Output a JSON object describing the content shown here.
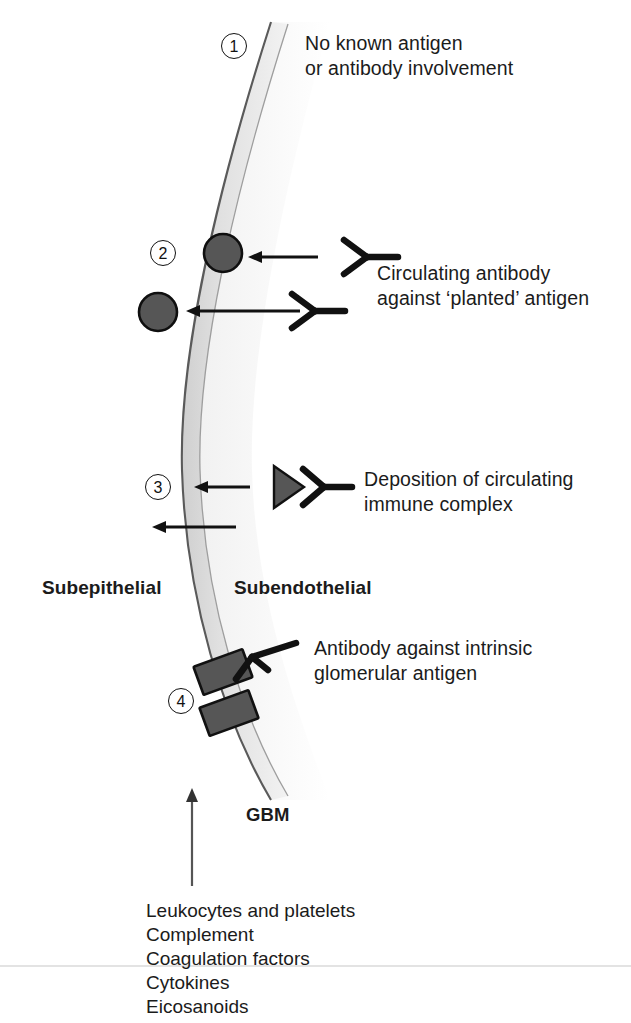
{
  "figure": {
    "background_color": "#ffffff",
    "membrane_color_light": "#e4e4e4",
    "membrane_color_mid": "#d2d2d2",
    "membrane_outline_color": "#6e6e6e",
    "particle_fill_color": "#565656",
    "particle_outline_color": "#0f0f0f",
    "ink_color": "#111111",
    "text_color": "#1b1b1b"
  },
  "markers": {
    "one": "1",
    "two": "2",
    "three": "3",
    "four": "4"
  },
  "annotations": {
    "one": {
      "line1": "No known antigen",
      "line2": "or antibody involvement"
    },
    "two": {
      "line1": "Circulating antibody",
      "line2": "against ‘planted’ antigen"
    },
    "three": {
      "line1": "Deposition of circulating",
      "line2": "immune complex"
    },
    "four": {
      "line1": "Antibody against intrinsic",
      "line2": "glomerular antigen"
    }
  },
  "zone_labels": {
    "subepithelial": "Subepithelial",
    "subendothelial": "Subendothelial",
    "gbm": "GBM"
  },
  "mediators": {
    "items": [
      "Leukocytes and platelets",
      "Complement",
      "Coagulation factors",
      "Cytokines",
      "Eicosanoids"
    ]
  }
}
